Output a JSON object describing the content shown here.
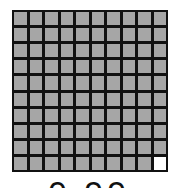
{
  "grid": {
    "rows": 10,
    "cols": 10,
    "filled": 99,
    "total": 100,
    "colors": {
      "filled": "#a6a6a6",
      "empty": "#ffffff",
      "border": "#111111"
    }
  },
  "caption": "0.99"
}
